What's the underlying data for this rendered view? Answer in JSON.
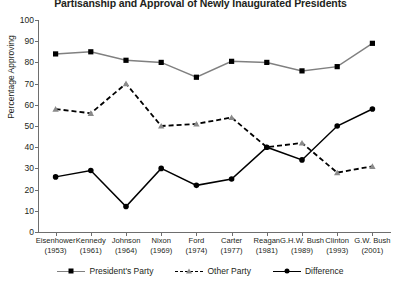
{
  "chart_data": {
    "type": "line",
    "title": "Partisanship and Approval of Newly Inaugurated Presidents",
    "xlabel": "",
    "ylabel": "Percentage Approving",
    "ylim": [
      0,
      100
    ],
    "yticks": [
      0,
      10,
      20,
      30,
      40,
      50,
      60,
      70,
      80,
      90,
      100
    ],
    "grid": false,
    "legend_position": "bottom",
    "categories": [
      "Eisenhower",
      "Kennedy",
      "Johnson",
      "Nixon",
      "Ford",
      "Carter",
      "Reagan",
      "G.H.W. Bush",
      "Clinton",
      "G.W. Bush"
    ],
    "category_years": [
      "(1953)",
      "(1961)",
      "(1964)",
      "(1969)",
      "(1974)",
      "(1977)",
      "(1981)",
      "(1989)",
      "(1993)",
      "(2001)"
    ],
    "series": [
      {
        "name": "President's Party",
        "marker": "square",
        "line": "solid",
        "color": "#808080",
        "marker_color": "#000000",
        "values": [
          84,
          85,
          81,
          80,
          73,
          80.5,
          80,
          76,
          78,
          89
        ]
      },
      {
        "name": "Other Party",
        "marker": "triangle",
        "line": "dashed",
        "color": "#000000",
        "marker_color": "#8a8a8a",
        "values": [
          58,
          56,
          70,
          50,
          51,
          54,
          40,
          42,
          28,
          31
        ]
      },
      {
        "name": "Difference",
        "marker": "circle",
        "line": "solid",
        "color": "#000000",
        "marker_color": "#000000",
        "values": [
          26,
          29,
          12,
          30,
          22,
          25,
          40,
          34,
          50,
          58
        ]
      }
    ]
  },
  "legend": {
    "items": [
      {
        "label": "President's Party"
      },
      {
        "label": "Other Party"
      },
      {
        "label": "Difference"
      }
    ]
  }
}
